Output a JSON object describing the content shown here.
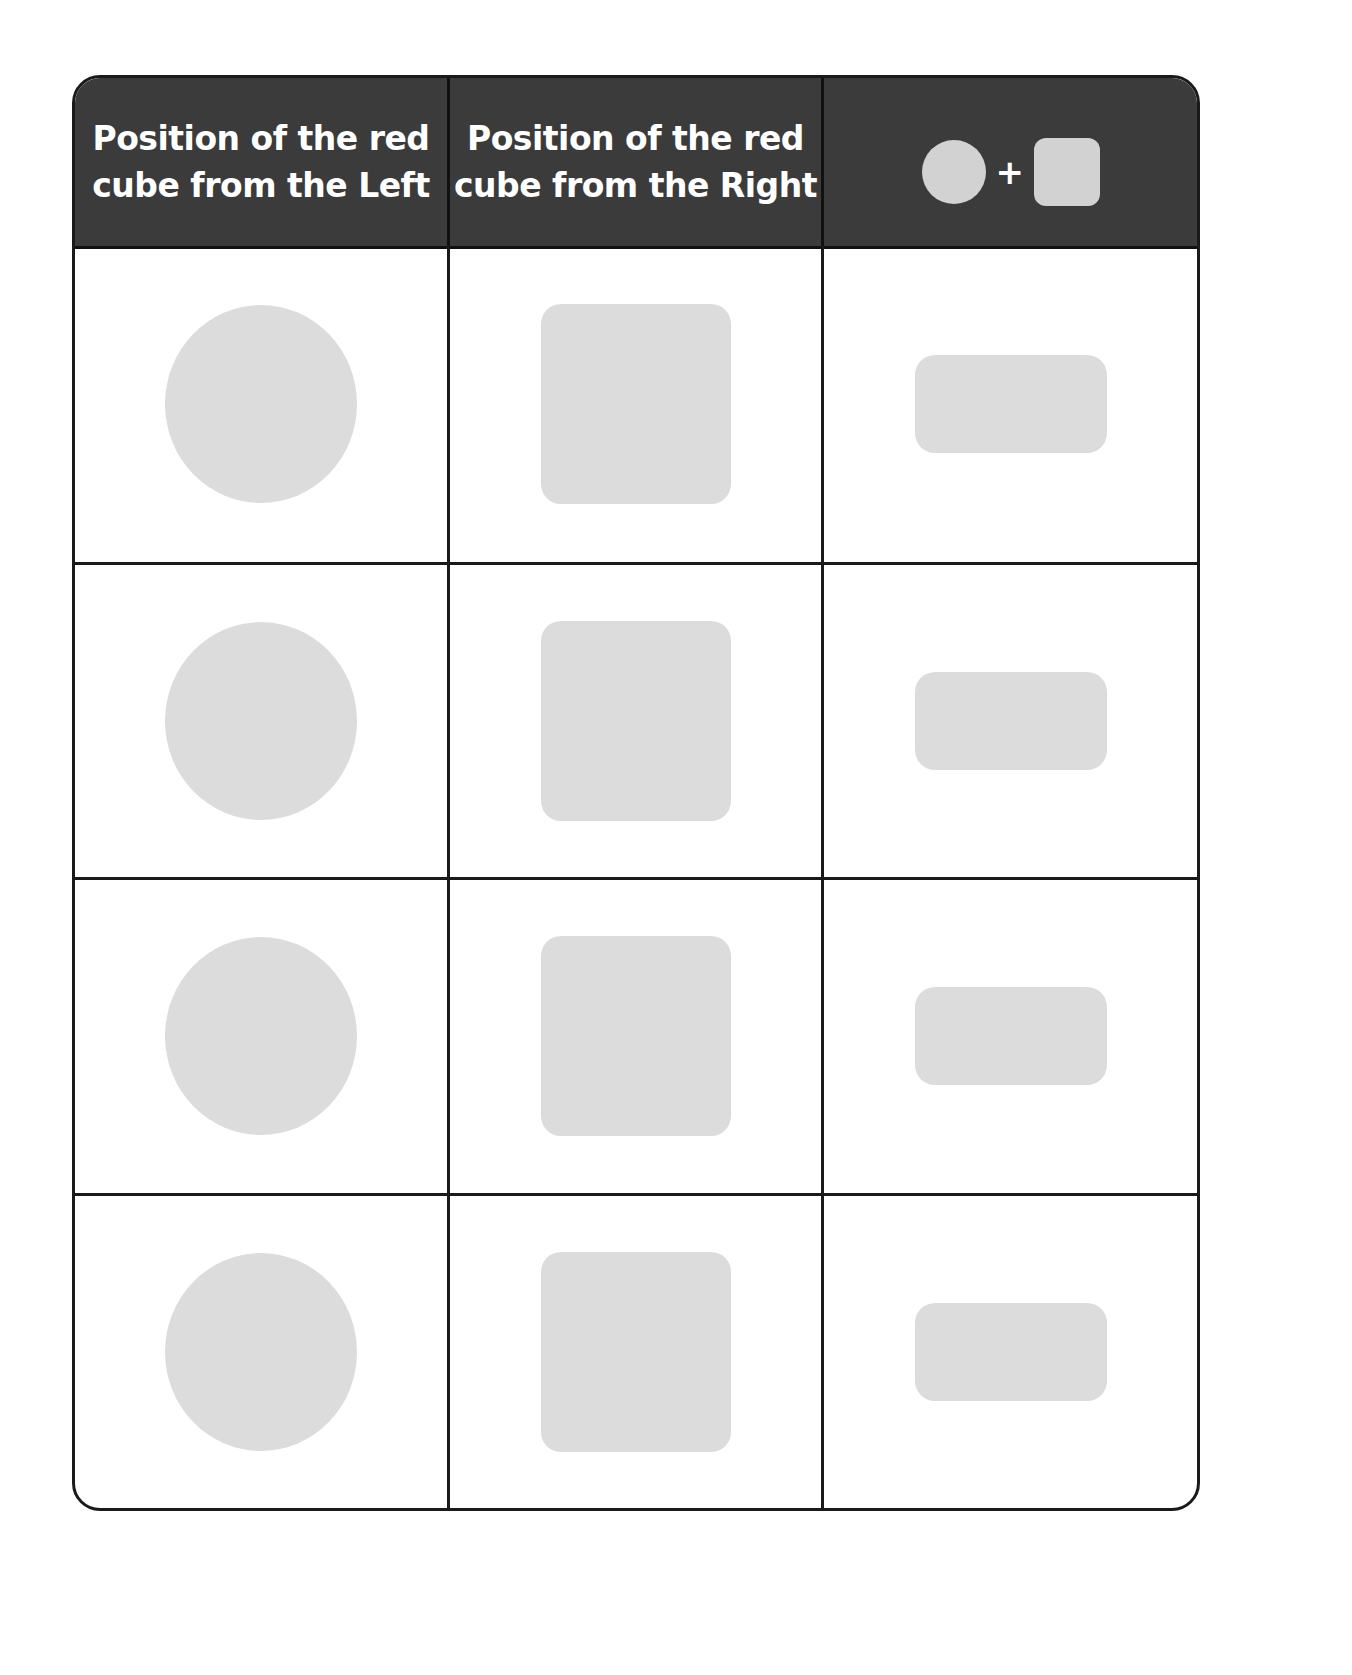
{
  "table": {
    "headers": [
      {
        "label": "Position of the red\ncube from the Left"
      },
      {
        "label": "Position of the red\ncube from the Right"
      },
      {
        "label": "",
        "legend": {
          "left_shape": "circle-icon",
          "operator": "+",
          "right_shape": "square-icon"
        }
      }
    ],
    "rows": [
      {
        "left": "",
        "right": "",
        "sum": ""
      },
      {
        "left": "",
        "right": "",
        "sum": ""
      },
      {
        "left": "",
        "right": "",
        "sum": ""
      },
      {
        "left": "",
        "right": "",
        "sum": ""
      }
    ],
    "colors": {
      "header_bg": "#3b3b3b",
      "header_text": "#ffffff",
      "shape_fill": "#dcdcdc",
      "border": "#1a1a1a"
    }
  }
}
